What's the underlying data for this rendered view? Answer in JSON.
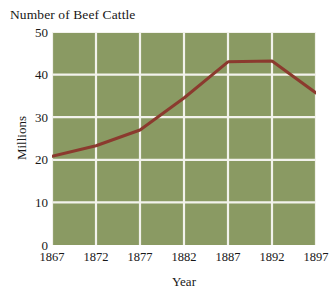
{
  "chart_data": {
    "type": "line",
    "title": "Number of Beef Cattle",
    "subtitle": "",
    "xlabel": "Year",
    "ylabel": "Millions",
    "x": [
      1867,
      1872,
      1877,
      1882,
      1887,
      1892,
      1897
    ],
    "categories": [
      "1867",
      "1872",
      "1877",
      "1882",
      "1887",
      "1892",
      "1897"
    ],
    "values": [
      20.8,
      23.3,
      27.0,
      34.5,
      43.0,
      43.2,
      35.7
    ],
    "series": [
      {
        "name": "Beef Cattle",
        "values": [
          20.8,
          23.3,
          27.0,
          34.5,
          43.0,
          43.2,
          35.7
        ]
      }
    ],
    "xlim": [
      1867,
      1897
    ],
    "ylim": [
      0,
      50
    ],
    "yticks": [
      0,
      10,
      20,
      30,
      40,
      50
    ],
    "ytick_labels": [
      "0",
      "10",
      "20",
      "30",
      "40",
      "50"
    ],
    "xticks": [
      1867,
      1872,
      1877,
      1882,
      1887,
      1892,
      1897
    ],
    "xtick_labels": [
      "1867",
      "1872",
      "1877",
      "1882",
      "1887",
      "1892",
      "1897"
    ],
    "grid": true,
    "legend": false,
    "legend_position": "none",
    "annotations": []
  },
  "style": {
    "plot_background": "#8a9a63",
    "grid_color": "#f2f2ec",
    "line_color": "#8b3a2e",
    "text_color": "#181818",
    "page_background": "#ffffff"
  }
}
